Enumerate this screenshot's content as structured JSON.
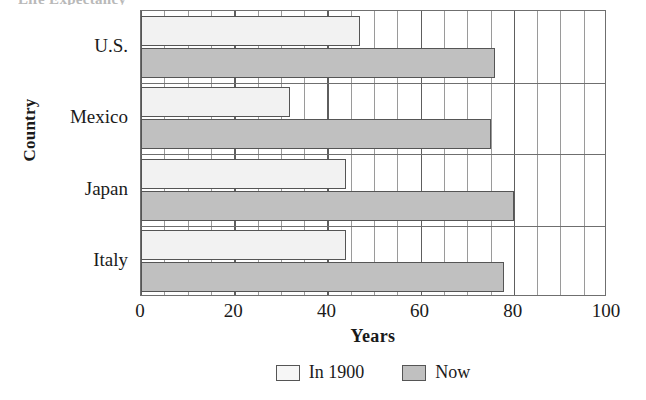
{
  "chart_data": {
    "type": "bar",
    "orientation": "horizontal",
    "title": "",
    "xlabel": "Years",
    "ylabel": "Country",
    "categories": [
      "U.S.",
      "Mexico",
      "Japan",
      "Italy"
    ],
    "series": [
      {
        "name": "In 1900",
        "color": "#f2f2f2",
        "values": [
          47,
          32,
          44,
          44
        ]
      },
      {
        "name": "Now",
        "color": "#c0c0c0",
        "values": [
          76,
          75,
          80,
          78
        ]
      }
    ],
    "xlim": [
      0,
      100
    ],
    "xticks": [
      0,
      20,
      40,
      60,
      80,
      100
    ],
    "xticklabels": [
      "0",
      "20",
      "40",
      "60",
      "80",
      "100"
    ],
    "minor_tick_step": 5,
    "grid": "vertical-major-and-minor",
    "legend_position": "bottom-center"
  },
  "axes": {
    "y_title": "Country",
    "x_title": "Years",
    "y_tick_labels": [
      "U.S.",
      "Mexico",
      "Japan",
      "Italy"
    ],
    "x_tick_labels": [
      "0",
      "20",
      "40",
      "60",
      "80",
      "100"
    ]
  },
  "legend": {
    "items": [
      {
        "label": "In 1900",
        "swatch": "light-gray-swatch"
      },
      {
        "label": "Now",
        "swatch": "dark-gray-swatch"
      }
    ]
  },
  "title_sliver": {
    "text": "Life Expectancy"
  },
  "colors": {
    "series_1900": "#f2f2f2",
    "series_now": "#c0c0c0",
    "axis": "#6f6f6f",
    "grid_minor": "#9a9a9a",
    "grid_major": "#5e5e5e",
    "text": "#1a1a1a"
  }
}
